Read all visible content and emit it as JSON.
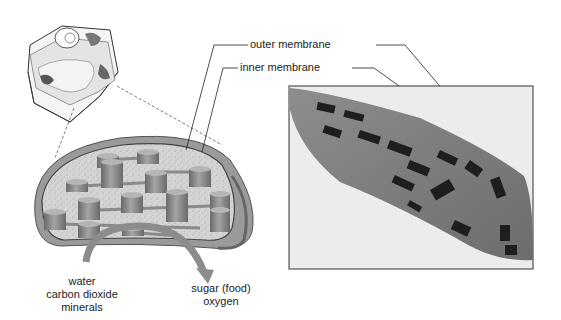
{
  "diagram": {
    "callouts": {
      "outer_membrane": "outer membrane",
      "inner_membrane": "inner membrane"
    },
    "inputs": [
      "water",
      "carbon dioxide",
      "minerals"
    ],
    "outputs": [
      "sugar (food)",
      "oxygen"
    ]
  },
  "colors": {
    "stroma": "#cfcfcf",
    "membrane": "#6e6e6e",
    "granum": "#8a8a8a",
    "micrograph_bg": "#e6e6e6",
    "arrow": "#8c8c8c"
  }
}
